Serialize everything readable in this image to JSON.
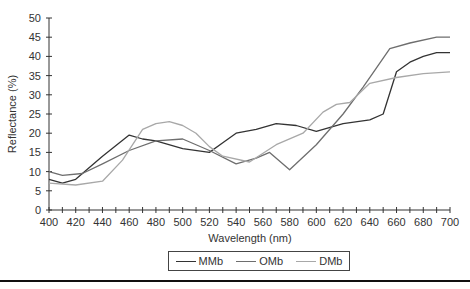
{
  "chart_data": {
    "type": "line",
    "title": "",
    "xlabel": "Wavelength (nm)",
    "ylabel": "Reflectance (%)",
    "xlim": [
      400,
      700
    ],
    "ylim": [
      0,
      50
    ],
    "x_ticks": [
      400,
      420,
      440,
      460,
      480,
      500,
      520,
      540,
      560,
      580,
      600,
      620,
      640,
      660,
      680,
      700
    ],
    "y_ticks": [
      0,
      5,
      10,
      15,
      20,
      25,
      30,
      35,
      40,
      45,
      50
    ],
    "grid": false,
    "legend_position": "bottom",
    "series": [
      {
        "name": "MMb",
        "color": "#333333",
        "points": [
          [
            400,
            8
          ],
          [
            410,
            7
          ],
          [
            420,
            8
          ],
          [
            440,
            14
          ],
          [
            460,
            19.5
          ],
          [
            470,
            18.5
          ],
          [
            480,
            18
          ],
          [
            500,
            16
          ],
          [
            520,
            15
          ],
          [
            530,
            17.5
          ],
          [
            540,
            20
          ],
          [
            555,
            21
          ],
          [
            570,
            22.5
          ],
          [
            585,
            22
          ],
          [
            600,
            20.5
          ],
          [
            620,
            22.5
          ],
          [
            640,
            23.5
          ],
          [
            650,
            25
          ],
          [
            660,
            36
          ],
          [
            670,
            38.5
          ],
          [
            680,
            40
          ],
          [
            690,
            41
          ],
          [
            700,
            41
          ]
        ]
      },
      {
        "name": "OMb",
        "color": "#6e6e6e",
        "points": [
          [
            400,
            10
          ],
          [
            410,
            9
          ],
          [
            425,
            9.5
          ],
          [
            440,
            12
          ],
          [
            460,
            15.5
          ],
          [
            480,
            18
          ],
          [
            500,
            18.5
          ],
          [
            520,
            15.5
          ],
          [
            540,
            12
          ],
          [
            555,
            13.5
          ],
          [
            565,
            15
          ],
          [
            580,
            10.5
          ],
          [
            600,
            17
          ],
          [
            620,
            25
          ],
          [
            635,
            32
          ],
          [
            645,
            37
          ],
          [
            655,
            42
          ],
          [
            670,
            43.5
          ],
          [
            690,
            45
          ],
          [
            700,
            45
          ]
        ]
      },
      {
        "name": "DMb",
        "color": "#a8a8a8",
        "points": [
          [
            400,
            7
          ],
          [
            420,
            6.5
          ],
          [
            440,
            7.5
          ],
          [
            455,
            13
          ],
          [
            470,
            21
          ],
          [
            480,
            22.5
          ],
          [
            490,
            23
          ],
          [
            500,
            22
          ],
          [
            510,
            20
          ],
          [
            520,
            16.5
          ],
          [
            530,
            14
          ],
          [
            550,
            12.5
          ],
          [
            570,
            17
          ],
          [
            590,
            20
          ],
          [
            605,
            25.5
          ],
          [
            615,
            27.5
          ],
          [
            625,
            28
          ],
          [
            640,
            33
          ],
          [
            660,
            34.5
          ],
          [
            680,
            35.5
          ],
          [
            700,
            36
          ]
        ]
      }
    ]
  },
  "legend": {
    "items": [
      {
        "label": "MMb",
        "color": "#333333"
      },
      {
        "label": "OMb",
        "color": "#6e6e6e"
      },
      {
        "label": "DMb",
        "color": "#a8a8a8"
      }
    ]
  }
}
